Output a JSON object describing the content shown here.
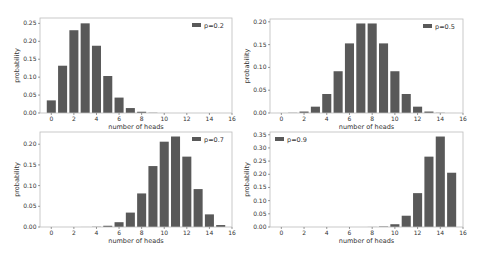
{
  "figure": {
    "width": 482,
    "height": 254,
    "bar_color": "#595959",
    "frame_color": "#bcbcbc"
  },
  "chart_data": [
    {
      "type": "bar",
      "title": "",
      "legend": "p=0.2",
      "legend_position": "upper right",
      "xlabel": "number of heads",
      "ylabel": "probability",
      "xlim": [
        -1,
        16
      ],
      "ylim": [
        0,
        0.265
      ],
      "xticks": [
        0,
        2,
        4,
        6,
        8,
        10,
        12,
        14,
        16
      ],
      "yticks": [
        0.0,
        0.05,
        0.1,
        0.15,
        0.2,
        0.25
      ],
      "ytick_labels": [
        "0.00",
        "0.05",
        "0.10",
        "0.15",
        "0.20",
        "0.25"
      ],
      "categories": [
        0,
        1,
        2,
        3,
        4,
        5,
        6,
        7,
        8,
        9,
        10,
        11,
        12,
        13,
        14,
        15
      ],
      "values": [
        0.0352,
        0.1319,
        0.2309,
        0.2501,
        0.1876,
        0.1032,
        0.043,
        0.0138,
        0.0035,
        0.0007,
        0.0001,
        0,
        0,
        0,
        0,
        0
      ],
      "grid": false
    },
    {
      "type": "bar",
      "title": "",
      "legend": "p=0.5",
      "legend_position": "upper right",
      "xlabel": "number of heads",
      "ylabel": "probability",
      "xlim": [
        -1,
        16
      ],
      "ylim": [
        0,
        0.2062
      ],
      "xticks": [
        0,
        2,
        4,
        6,
        8,
        10,
        12,
        14,
        16
      ],
      "yticks": [
        0.0,
        0.05,
        0.1,
        0.15,
        0.2
      ],
      "ytick_labels": [
        "0.00",
        "0.05",
        "0.10",
        "0.15",
        "0.20"
      ],
      "categories": [
        0,
        1,
        2,
        3,
        4,
        5,
        6,
        7,
        8,
        9,
        10,
        11,
        12,
        13,
        14,
        15
      ],
      "values": [
        3e-05,
        0.0005,
        0.0032,
        0.0139,
        0.0417,
        0.0916,
        0.1527,
        0.1964,
        0.1964,
        0.1527,
        0.0916,
        0.0417,
        0.0139,
        0.0032,
        0.0005,
        3e-05
      ],
      "grid": false
    },
    {
      "type": "bar",
      "title": "",
      "legend": "p=0.7",
      "legend_position": "upper right",
      "xlabel": "number of heads",
      "ylabel": "probability",
      "xlim": [
        -1,
        16
      ],
      "ylim": [
        0,
        0.2295
      ],
      "xticks": [
        0,
        2,
        4,
        6,
        8,
        10,
        12,
        14,
        16
      ],
      "yticks": [
        0.0,
        0.05,
        0.1,
        0.15,
        0.2
      ],
      "ytick_labels": [
        "0.00",
        "0.05",
        "0.10",
        "0.15",
        "0.20"
      ],
      "categories": [
        0,
        1,
        2,
        3,
        4,
        5,
        6,
        7,
        8,
        9,
        10,
        11,
        12,
        13,
        14,
        15
      ],
      "values": [
        0,
        0,
        0,
        0.0001,
        0.0006,
        0.003,
        0.0116,
        0.0348,
        0.0811,
        0.1472,
        0.2061,
        0.2186,
        0.17,
        0.0916,
        0.0305,
        0.0047
      ],
      "grid": false
    },
    {
      "type": "bar",
      "title": "",
      "legend": "p=0.9",
      "legend_position": "upper left",
      "xlabel": "number of heads",
      "ylabel": "probability",
      "xlim": [
        -1,
        16
      ],
      "ylim": [
        0,
        0.3604
      ],
      "xticks": [
        0,
        2,
        4,
        6,
        8,
        10,
        12,
        14,
        16
      ],
      "yticks": [
        0.0,
        0.05,
        0.1,
        0.15,
        0.2,
        0.25,
        0.3,
        0.35
      ],
      "ytick_labels": [
        "0.00",
        "0.05",
        "0.10",
        "0.15",
        "0.20",
        "0.25",
        "0.30",
        "0.35"
      ],
      "categories": [
        0,
        1,
        2,
        3,
        4,
        5,
        6,
        7,
        8,
        9,
        10,
        11,
        12,
        13,
        14,
        15
      ],
      "values": [
        0,
        0,
        0,
        0,
        0,
        0,
        0,
        0,
        0.0003,
        0.0019,
        0.0105,
        0.0428,
        0.1285,
        0.2669,
        0.3432,
        0.2059
      ],
      "grid": false
    }
  ],
  "panels": [
    {
      "x0": 40,
      "y0": 18,
      "x1": 232,
      "y1": 113
    },
    {
      "x0": 270,
      "y0": 19,
      "x1": 463,
      "y1": 113
    },
    {
      "x0": 40,
      "y0": 132,
      "x1": 232,
      "y1": 227
    },
    {
      "x0": 270,
      "y0": 132,
      "x1": 463,
      "y1": 227
    }
  ]
}
